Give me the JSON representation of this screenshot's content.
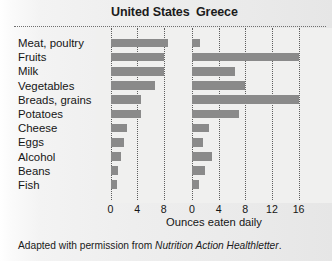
{
  "chart_data": {
    "type": "bar",
    "title": "",
    "orientation": "horizontal",
    "panels": [
      {
        "name": "United States",
        "xlabel": "Ounces eaten daily",
        "xlim": [
          0,
          10
        ],
        "ticks": [
          0,
          4,
          8
        ],
        "tick_labels": [
          "0",
          "4",
          "8"
        ],
        "values": [
          8.6,
          8.0,
          8.0,
          6.7,
          4.6,
          4.6,
          2.5,
          2.0,
          1.6,
          1.2,
          1.0
        ]
      },
      {
        "name": "Greece",
        "xlabel": "Ounces eaten daily",
        "xlim": [
          0,
          17.5
        ],
        "ticks": [
          0,
          4,
          8,
          12,
          16
        ],
        "tick_labels": [
          "0",
          "4",
          "8",
          "12",
          "16"
        ],
        "values": [
          1.2,
          16.0,
          6.4,
          8.0,
          16.0,
          7.0,
          2.6,
          1.6,
          3.0,
          2.0,
          1.0
        ]
      }
    ],
    "categories": [
      "Meat, poultry",
      "Fruits",
      "Milk",
      "Vegetables",
      "Breads, grains",
      "Potatoes",
      "Cheese",
      "Eggs",
      "Alcohol",
      "Beans",
      "Fish"
    ],
    "xlabel": "Ounces eaten daily",
    "ylabel": "",
    "grid": true,
    "legend": "none",
    "bar_color": "#8a8a8a",
    "background_color": "#eeeeee"
  },
  "headers": {
    "united_states": "United States",
    "greece": "Greece"
  },
  "axis": {
    "title": "Ounces eaten daily"
  },
  "caption": {
    "prefix": "Adapted with permission from ",
    "source": "Nutrition Action Healthletter",
    "suffix": "."
  }
}
